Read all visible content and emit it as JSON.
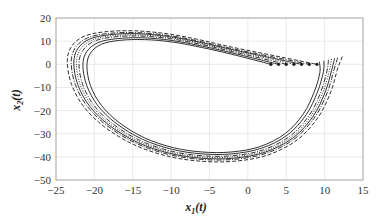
{
  "chart_data": {
    "type": "line",
    "title": "",
    "xlabel": "x",
    "xlabel_sub": "1",
    "xlabel_suffix": "(t)",
    "ylabel": "x",
    "ylabel_sub": "2",
    "ylabel_suffix": "(t)",
    "xlim": [
      -25,
      15
    ],
    "ylim": [
      -50,
      20
    ],
    "xticks": [
      -25,
      -20,
      -15,
      -10,
      -5,
      0,
      5,
      10,
      15
    ],
    "yticks": [
      -50,
      -40,
      -30,
      -20,
      -10,
      0,
      10,
      20
    ],
    "xtick_labels": [
      "−25",
      "−20",
      "−15",
      "−10",
      "−5",
      "0",
      "5",
      "10",
      "15"
    ],
    "ytick_labels": [
      "−50",
      "−40",
      "−30",
      "−20",
      "−10",
      "0",
      "10",
      "20"
    ],
    "grid": true,
    "legend": null,
    "series": [
      {
        "name": "trajectory-1",
        "style": "solid",
        "scale": 0.94,
        "end_x": 3.0
      },
      {
        "name": "trajectory-2",
        "style": "solid",
        "scale": 0.97,
        "end_x": 4.0
      },
      {
        "name": "trajectory-3",
        "style": "dashdot",
        "scale": 1.0,
        "end_x": 5.0
      },
      {
        "name": "trajectory-4",
        "style": "dotted",
        "scale": 1.02,
        "end_x": 6.0
      },
      {
        "name": "trajectory-5",
        "style": "solid",
        "scale": 1.04,
        "end_x": 7.0
      },
      {
        "name": "trajectory-6",
        "style": "dashdot",
        "scale": 1.06,
        "end_x": 8.0
      },
      {
        "name": "trajectory-7",
        "style": "dashed",
        "scale": 1.09,
        "end_x": 9.0
      }
    ],
    "base_path": {
      "x": [
        10.5,
        10.3,
        9.5,
        8.0,
        5.5,
        2.0,
        -2.0,
        -6.0,
        -10.0,
        -14.0,
        -17.5,
        -20.0,
        -21.5,
        -22.0,
        -21.5,
        -20.0,
        -17.5,
        -14.0,
        -10.0,
        -6.0,
        -2.0,
        2.0
      ],
      "y": [
        2.0,
        -3.0,
        -12.0,
        -22.0,
        -31.0,
        -37.0,
        -39.5,
        -39.5,
        -37.5,
        -33.0,
        -26.0,
        -18.0,
        -9.0,
        0.0,
        6.0,
        10.0,
        11.8,
        12.2,
        11.0,
        8.5,
        5.5,
        2.0
      ]
    }
  }
}
